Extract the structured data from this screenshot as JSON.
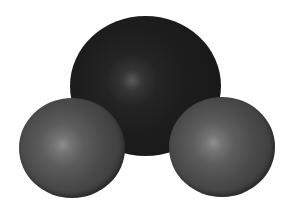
{
  "image": {
    "subject": "space-filling molecular model",
    "background_color": "#ffffff",
    "spheres": [
      {
        "role": "central-atom",
        "size": "large",
        "base_color": "#1d1d1d",
        "highlight_color": "#5a5a5a"
      },
      {
        "role": "left-atom",
        "size": "small",
        "base_color": "#4a4a4a",
        "highlight_color": "#8e8e8e"
      },
      {
        "role": "right-atom",
        "size": "small",
        "base_color": "#4a4a4a",
        "highlight_color": "#8e8e8e"
      }
    ]
  }
}
